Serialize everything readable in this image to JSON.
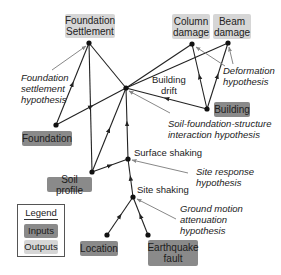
{
  "colors": {
    "input_fill": "#8a8a8a",
    "output_fill": "#d6d6d6",
    "edge": "#222222",
    "hypothesis_pointer": "#888888"
  },
  "nodes": {
    "foundation_settlement": {
      "label": "Foundation\nSettlement",
      "type": "output",
      "x": 89,
      "y": 43
    },
    "column_damage": {
      "label": "Column\ndamage",
      "type": "output",
      "x": 192,
      "y": 44
    },
    "beam_damage": {
      "label": "Beam\ndamage",
      "type": "output",
      "x": 228,
      "y": 43
    },
    "building_drift": {
      "label": "Building\ndrift",
      "type": "intermediate",
      "x": 126,
      "y": 88
    },
    "building": {
      "label": "Building",
      "type": "input",
      "x": 207,
      "y": 109
    },
    "foundation": {
      "label": "Foundation",
      "type": "input",
      "x": 56,
      "y": 125
    },
    "soil_profile": {
      "label": "Soil profile",
      "type": "input",
      "x": 92,
      "y": 172
    },
    "surface_shaking": {
      "label": "Surface shaking",
      "type": "intermediate",
      "x": 128,
      "y": 159
    },
    "site_shaking": {
      "label": "Site shaking",
      "type": "intermediate",
      "x": 133,
      "y": 197
    },
    "location": {
      "label": "Location",
      "type": "input",
      "x": 107,
      "y": 235
    },
    "earthquake_fault": {
      "label": "Earthquake\nfault",
      "type": "input",
      "x": 148,
      "y": 235
    }
  },
  "hypotheses": {
    "foundation_settlement": "Foundation\nsettlement\nhypothesis",
    "deformation": "Deformation\nhypothesis",
    "soil_foundation_structure": "Soil-foundation-structure\ninteraction hypothesis",
    "site_response": "Site response\nhypothesis",
    "ground_motion": "Ground motion\nattenuation\nhypothesis"
  },
  "legend": {
    "title": "Legend",
    "items": [
      {
        "label": "Inputs",
        "type": "input"
      },
      {
        "label": "Outputs",
        "type": "output"
      }
    ]
  },
  "edges": [
    [
      "foundation",
      "foundation_settlement"
    ],
    [
      "soil_profile",
      "foundation_settlement"
    ],
    [
      "building_drift",
      "foundation_settlement"
    ],
    [
      "foundation",
      "building_drift"
    ],
    [
      "soil_profile",
      "building_drift"
    ],
    [
      "surface_shaking",
      "building_drift"
    ],
    [
      "building",
      "building_drift"
    ],
    [
      "building_drift",
      "column_damage"
    ],
    [
      "building_drift",
      "beam_damage"
    ],
    [
      "building",
      "column_damage"
    ],
    [
      "building",
      "beam_damage"
    ],
    [
      "soil_profile",
      "surface_shaking"
    ],
    [
      "site_shaking",
      "surface_shaking"
    ],
    [
      "location",
      "site_shaking"
    ],
    [
      "earthquake_fault",
      "site_shaking"
    ]
  ]
}
